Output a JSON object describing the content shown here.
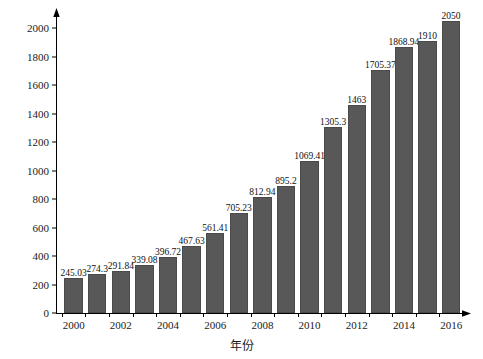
{
  "chart_data": {
    "type": "bar",
    "title": "",
    "xlabel": "年份",
    "ylabel": "天然气表观消费量/10",
    "ylabel_unit_exponent": "8",
    "ylabel_unit_suffix": "m",
    "ylabel_unit_suffix_exponent": "3",
    "ylabel_full": "天然气表观消费量/10⁸m³",
    "categories": [
      "2000",
      "2001",
      "2002",
      "2003",
      "2004",
      "2005",
      "2006",
      "2007",
      "2008",
      "2009",
      "2010",
      "2011",
      "2012",
      "2013",
      "2014",
      "2015",
      "2016"
    ],
    "values": [
      245.03,
      274.3,
      291.84,
      339.08,
      396.72,
      467.63,
      561.41,
      705.23,
      812.94,
      895.2,
      1069.41,
      1305.3,
      1463,
      1705.37,
      1868.94,
      1910,
      2050
    ],
    "value_labels": [
      "245.03",
      "274.3",
      "291.84",
      "339.08",
      "396.72",
      "467.63",
      "561.41",
      "705.23",
      "812.94",
      "895.2",
      "1069.41",
      "1305.3",
      "1463",
      "1705.37",
      "1868.94",
      "1910",
      "2050"
    ],
    "ylim": [
      0,
      2100
    ],
    "yticks": [
      0,
      200,
      400,
      600,
      800,
      1000,
      1200,
      1400,
      1600,
      1800,
      2000
    ],
    "ytick_labels": [
      "0",
      "200",
      "400",
      "600",
      "800",
      "1000",
      "1200",
      "1400",
      "1600",
      "1800",
      "2000"
    ],
    "xtick_labels": [
      "2000",
      "2002",
      "2004",
      "2006",
      "2008",
      "2010",
      "2012",
      "2014",
      "2016"
    ],
    "grid": false,
    "legend": null,
    "bar_color": "#585858",
    "axis_color": "#000000",
    "background_color": "#ffffff"
  }
}
